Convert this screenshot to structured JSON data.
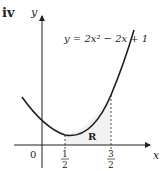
{
  "part_label": "iv",
  "axes": {
    "x_label": "x",
    "y_label": "y",
    "origin_label": "0"
  },
  "equation": "y = 2x² − 2x + 1",
  "region_label": "R",
  "ticks": [
    {
      "num": "1",
      "den": "2",
      "value": 0.5
    },
    {
      "num": "3",
      "den": "2",
      "value": 1.5
    }
  ],
  "colors": {
    "ink": "#231f20",
    "region_fill": "#f2f2f2"
  }
}
